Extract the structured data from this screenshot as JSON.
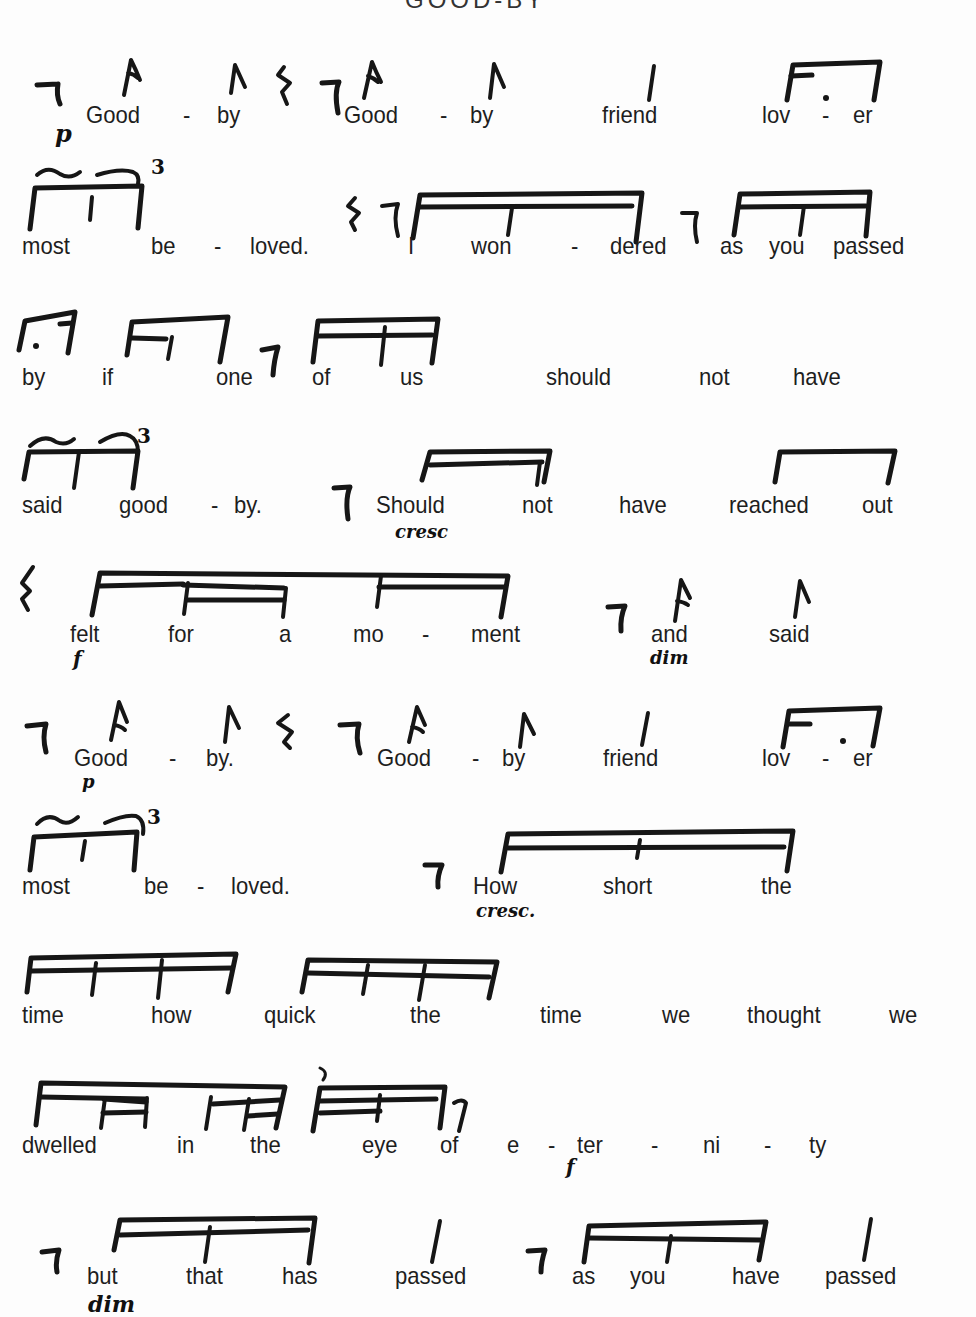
{
  "page": {
    "title_fragment": "GOOD-BY",
    "rows": [
      {
        "id": "row-1",
        "syllables": [
          {
            "text": "Good",
            "x": 86
          },
          {
            "text": "-",
            "x": 183
          },
          {
            "text": "by",
            "x": 217
          },
          {
            "text": "Good",
            "x": 344
          },
          {
            "text": "-",
            "x": 440
          },
          {
            "text": "by",
            "x": 470
          },
          {
            "text": "friend",
            "x": 602
          },
          {
            "text": "lov",
            "x": 762
          },
          {
            "text": "-",
            "x": 822
          },
          {
            "text": "er",
            "x": 853
          }
        ],
        "dynamics": [
          {
            "mark": "p",
            "x": 55,
            "y_offset": 18
          }
        ]
      },
      {
        "id": "row-2",
        "syllables": [
          {
            "text": "most",
            "x": 22
          },
          {
            "text": "be",
            "x": 151
          },
          {
            "text": "-",
            "x": 214
          },
          {
            "text": "loved.",
            "x": 250
          },
          {
            "text": "I",
            "x": 408
          },
          {
            "text": "won",
            "x": 471
          },
          {
            "text": "-",
            "x": 571
          },
          {
            "text": "dered",
            "x": 610
          },
          {
            "text": "as",
            "x": 720
          },
          {
            "text": "you",
            "x": 769
          },
          {
            "text": "passed",
            "x": 833
          }
        ],
        "tuplets": [
          "3"
        ]
      },
      {
        "id": "row-3",
        "syllables": [
          {
            "text": "by",
            "x": 22
          },
          {
            "text": "if",
            "x": 102
          },
          {
            "text": "one",
            "x": 216
          },
          {
            "text": "of",
            "x": 312
          },
          {
            "text": "us",
            "x": 400
          },
          {
            "text": "should",
            "x": 546
          },
          {
            "text": "not",
            "x": 699
          },
          {
            "text": "have",
            "x": 793
          }
        ]
      },
      {
        "id": "row-4",
        "syllables": [
          {
            "text": "said",
            "x": 22
          },
          {
            "text": "good",
            "x": 119
          },
          {
            "text": "-",
            "x": 211
          },
          {
            "text": "by.",
            "x": 234
          },
          {
            "text": "Should",
            "x": 376
          },
          {
            "text": "not",
            "x": 522
          },
          {
            "text": "have",
            "x": 619
          },
          {
            "text": "reached",
            "x": 729
          },
          {
            "text": "out",
            "x": 862
          }
        ],
        "tuplets": [
          "3"
        ],
        "dynamics": [
          {
            "mark": "cresc",
            "x": 395,
            "y_offset": 18
          }
        ]
      },
      {
        "id": "row-5",
        "syllables": [
          {
            "text": "felt",
            "x": 70
          },
          {
            "text": "for",
            "x": 168
          },
          {
            "text": "a",
            "x": 279
          },
          {
            "text": "mo",
            "x": 353
          },
          {
            "text": "-",
            "x": 422
          },
          {
            "text": "ment",
            "x": 471
          },
          {
            "text": "and",
            "x": 651
          },
          {
            "text": "said",
            "x": 769
          }
        ],
        "dynamics": [
          {
            "mark": "f",
            "x": 73,
            "y_offset": 20
          },
          {
            "mark": "dim",
            "x": 650,
            "y_offset": 16
          }
        ]
      },
      {
        "id": "row-6",
        "syllables": [
          {
            "text": "Good",
            "x": 74
          },
          {
            "text": "-",
            "x": 169
          },
          {
            "text": "by.",
            "x": 206
          },
          {
            "text": "Good",
            "x": 377
          },
          {
            "text": "-",
            "x": 472
          },
          {
            "text": "by",
            "x": 502
          },
          {
            "text": "friend",
            "x": 603
          },
          {
            "text": "lov",
            "x": 762
          },
          {
            "text": "-",
            "x": 822
          },
          {
            "text": "er",
            "x": 853
          }
        ],
        "dynamics": [
          {
            "mark": "p",
            "x": 82,
            "y_offset": 16
          }
        ]
      },
      {
        "id": "row-7",
        "syllables": [
          {
            "text": "most",
            "x": 22
          },
          {
            "text": "be",
            "x": 144
          },
          {
            "text": "-",
            "x": 197
          },
          {
            "text": "loved.",
            "x": 231
          },
          {
            "text": "How",
            "x": 473
          },
          {
            "text": "short",
            "x": 603
          },
          {
            "text": "the",
            "x": 761
          }
        ],
        "tuplets": [
          "3"
        ],
        "dynamics": [
          {
            "mark": "cresc.",
            "x": 476,
            "y_offset": 18
          }
        ]
      },
      {
        "id": "row-8",
        "syllables": [
          {
            "text": "time",
            "x": 22
          },
          {
            "text": "how",
            "x": 151
          },
          {
            "text": "quick",
            "x": 264
          },
          {
            "text": "the",
            "x": 410
          },
          {
            "text": "time",
            "x": 540
          },
          {
            "text": "we",
            "x": 662
          },
          {
            "text": "thought",
            "x": 747
          },
          {
            "text": "we",
            "x": 889
          }
        ]
      },
      {
        "id": "row-9",
        "syllables": [
          {
            "text": "dwelled",
            "x": 22
          },
          {
            "text": "in",
            "x": 177
          },
          {
            "text": "the",
            "x": 250
          },
          {
            "text": "eye",
            "x": 362
          },
          {
            "text": "of",
            "x": 440
          },
          {
            "text": "e",
            "x": 507
          },
          {
            "text": "-",
            "x": 548
          },
          {
            "text": "ter",
            "x": 577
          },
          {
            "text": "-",
            "x": 651
          },
          {
            "text": "ni",
            "x": 703
          },
          {
            "text": "-",
            "x": 764
          },
          {
            "text": "ty",
            "x": 809
          }
        ],
        "dynamics": [
          {
            "mark": "f",
            "x": 566,
            "y_offset": 20
          }
        ]
      },
      {
        "id": "row-10",
        "syllables": [
          {
            "text": "but",
            "x": 87
          },
          {
            "text": "that",
            "x": 186
          },
          {
            "text": "has",
            "x": 282
          },
          {
            "text": "passed",
            "x": 395
          },
          {
            "text": "as",
            "x": 572
          },
          {
            "text": "you",
            "x": 630
          },
          {
            "text": "have",
            "x": 732
          },
          {
            "text": "passed",
            "x": 825
          }
        ],
        "dynamics": [
          {
            "mark": "dim",
            "x": 88,
            "y_offset": 20
          }
        ]
      }
    ]
  }
}
